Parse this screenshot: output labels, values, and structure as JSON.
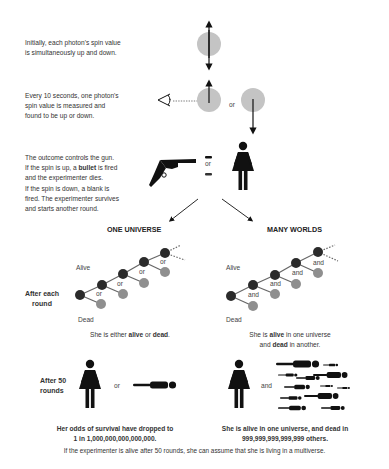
{
  "steps": {
    "initial": {
      "line1": "Initially, each photon's spin value",
      "line2": "is simultaneously up and down."
    },
    "measure": {
      "line1": "Every 10 seconds, one photon's",
      "line2": "spin value is measured and",
      "line3": "found to be up or down.",
      "or_label": "or"
    },
    "gun": {
      "line1": "The outcome controls the gun.",
      "line2_pre": "If the spin is up, a ",
      "line2_bold": "bullet",
      "line2_post": " is fired",
      "line3": "and the experimenter dies.",
      "line4": "If the spin is down, a blank is",
      "line5": "fired. The experimenter survives",
      "line6": "and starts another round.",
      "or_label": "or"
    }
  },
  "branches": {
    "one_universe": {
      "title": "ONE UNIVERSE",
      "alive_label": "Alive",
      "dead_label": "Dead",
      "connector": "or",
      "caption_pre": "She is either ",
      "caption_bold1": "alive",
      "caption_mid": " or ",
      "caption_bold2": "dead",
      "caption_post": ".",
      "after50_connector": "or",
      "result_line1": "Her odds of survival have dropped to",
      "result_line2": "1 in 1,000,000,000,000,000."
    },
    "many_worlds": {
      "title": "MANY WORLDS",
      "alive_label": "Alive",
      "dead_label": "Dead",
      "connector": "and",
      "caption1_pre": "She is ",
      "caption1_bold": "alive",
      "caption1_post": " in one universe",
      "caption2_pre": "and ",
      "caption2_bold": "dead",
      "caption2_post": " in another.",
      "after50_connector": "and",
      "result_line1": "She is alive in one universe, and dead in",
      "result_line2": "999,999,999,999,999 others."
    }
  },
  "row_labels": {
    "after_each_round_1": "After each",
    "after_each_round_2": "round",
    "after_50_1": "After 50",
    "after_50_2": "rounds"
  },
  "footer": "If the experimenter is alive after 50 rounds, she can assume that she is living in a multiverse.",
  "colors": {
    "alive_node": "#2b2b2b",
    "dead_node": "#8f8f8f",
    "photon": "#c4c4c4",
    "ink": "#111111"
  }
}
